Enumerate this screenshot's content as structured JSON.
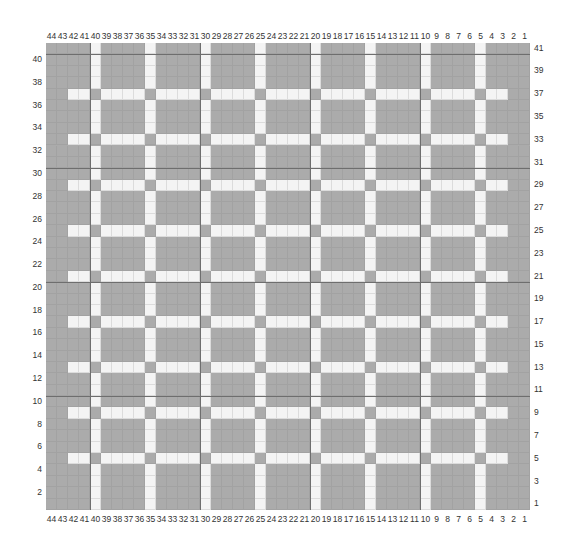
{
  "chart": {
    "title": "",
    "columns": 44,
    "rows": 41,
    "column_numbering": "right-to-left, 1 at right, 44 at left",
    "row_numbering": "bottom-to-top, 1 at bottom, 41 at top",
    "colors": {
      "background": "#ababab",
      "stripe": "#f4f4f4",
      "major_gridline": "#6e6e6e"
    },
    "vertical_white_columns": [
      40,
      35,
      30,
      25,
      20,
      15,
      10,
      5
    ],
    "horizontal_white_rows": [
      37,
      33,
      29,
      25,
      21,
      17,
      13,
      9,
      5
    ],
    "horizontal_white_col_range": [
      3,
      42
    ],
    "intersection_color": "gray",
    "major_hlines_above_rows": [
      40,
      30,
      20,
      10
    ],
    "major_vlines_left_of_cols": [
      40,
      30,
      20,
      10
    ],
    "top_col_labels": [
      "44",
      "43",
      "42",
      "41",
      "40",
      "39",
      "38",
      "37",
      "36",
      "35",
      "34",
      "33",
      "32",
      "31",
      "30",
      "29",
      "28",
      "27",
      "26",
      "25",
      "24",
      "23",
      "22",
      "21",
      "20",
      "19",
      "18",
      "17",
      "16",
      "15",
      "14",
      "13",
      "12",
      "11",
      "10",
      "9",
      "8",
      "7",
      "6",
      "5",
      "4",
      "3",
      "2",
      "1"
    ],
    "bottom_col_labels": [
      "44",
      "43",
      "42",
      "41",
      "40",
      "39",
      "38",
      "37",
      "36",
      "35",
      "34",
      "33",
      "32",
      "31",
      "30",
      "29",
      "28",
      "27",
      "26",
      "25",
      "24",
      "23",
      "22",
      "21",
      "20",
      "19",
      "18",
      "17",
      "16",
      "15",
      "14",
      "13",
      "12",
      "11",
      "10",
      "9",
      "8",
      "7",
      "6",
      "5",
      "4",
      "3",
      "2",
      "1"
    ],
    "left_row_labels": [
      "40",
      "38",
      "36",
      "34",
      "32",
      "30",
      "28",
      "26",
      "24",
      "22",
      "20",
      "18",
      "16",
      "14",
      "12",
      "10",
      "8",
      "6",
      "4",
      "2"
    ],
    "right_row_labels": [
      "41",
      "39",
      "37",
      "35",
      "33",
      "31",
      "29",
      "27",
      "25",
      "23",
      "21",
      "19",
      "17",
      "15",
      "13",
      "11",
      "9",
      "7",
      "5",
      "3",
      "1"
    ]
  }
}
